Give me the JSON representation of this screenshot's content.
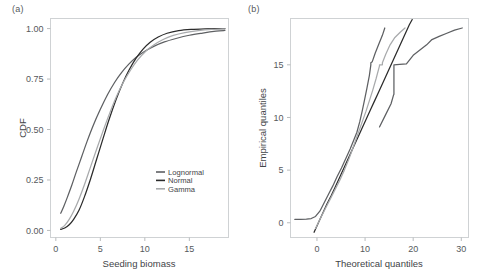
{
  "figure": {
    "panels": [
      {
        "key": "a",
        "label": "(a)",
        "xlabel": "Seeding biomass",
        "ylabel": "CDF"
      },
      {
        "key": "b",
        "label": "(b)",
        "xlabel": "Theoretical quantiles",
        "ylabel": "Empirical quantiles"
      }
    ]
  },
  "legend": {
    "items": [
      {
        "label": "Lognormal",
        "color": "#5e6063"
      },
      {
        "label": "Normal",
        "color": "#2b2b2b"
      },
      {
        "label": "Gamma",
        "color": "#a8aaac"
      }
    ]
  },
  "colors": {
    "lognormal": "#5e6063",
    "normal": "#2b2b2b",
    "gamma": "#a8aaac",
    "axis": "#cfd2d4",
    "tick": "#b9bcbe",
    "text": "#55595c"
  },
  "chart_data": [
    {
      "type": "line",
      "panel": "(a)",
      "title": "",
      "xlabel": "Seeding biomass",
      "ylabel": "CDF",
      "xlim": [
        -0.6,
        19.4
      ],
      "ylim": [
        -0.035,
        1.05
      ],
      "xticks": [
        0,
        5,
        10,
        15
      ],
      "yticks": [
        0.0,
        0.25,
        0.5,
        0.75,
        1.0
      ],
      "xtick_labels": [
        "0",
        "5",
        "10",
        "15"
      ],
      "ytick_labels": [
        "0.00",
        "0.25",
        "0.50",
        "0.75",
        "1.00"
      ],
      "grid": false,
      "legend_position": "lower-right-inside",
      "series": [
        {
          "name": "Lognormal",
          "color": "#5e6063",
          "x": [
            0.55,
            0.9,
            1.3,
            1.8,
            2.3,
            2.9,
            3.5,
            4.2,
            5.0,
            5.8,
            6.6,
            7.4,
            8.2,
            9.0,
            10.0,
            11.0,
            12.2,
            13.5,
            15.0,
            16.5,
            18.0,
            19.0
          ],
          "y": [
            0.085,
            0.12,
            0.165,
            0.225,
            0.29,
            0.365,
            0.44,
            0.52,
            0.6,
            0.672,
            0.733,
            0.783,
            0.824,
            0.857,
            0.888,
            0.912,
            0.934,
            0.951,
            0.967,
            0.978,
            0.987,
            0.991
          ]
        },
        {
          "name": "Normal",
          "color": "#2b2b2b",
          "x": [
            0.55,
            1.0,
            1.5,
            2.0,
            2.6,
            3.2,
            3.9,
            4.6,
            5.3,
            6.0,
            6.8,
            7.5,
            8.2,
            9.0,
            9.8,
            10.6,
            11.5,
            12.5,
            13.8,
            15.2,
            16.8,
            18.2,
            19.0
          ],
          "y": [
            0.005,
            0.012,
            0.028,
            0.055,
            0.1,
            0.165,
            0.255,
            0.355,
            0.455,
            0.552,
            0.652,
            0.728,
            0.792,
            0.852,
            0.898,
            0.932,
            0.958,
            0.977,
            0.99,
            0.996,
            0.999,
            1.0,
            1.0
          ]
        },
        {
          "name": "Gamma",
          "color": "#a8aaac",
          "x": [
            0.55,
            1.0,
            1.5,
            2.0,
            2.6,
            3.2,
            3.9,
            4.6,
            5.3,
            6.0,
            6.8,
            7.6,
            8.4,
            9.2,
            10.1,
            11.0,
            12.0,
            13.2,
            14.5,
            16.0,
            17.5,
            19.0
          ],
          "y": [
            0.01,
            0.025,
            0.055,
            0.095,
            0.155,
            0.225,
            0.315,
            0.405,
            0.492,
            0.575,
            0.662,
            0.735,
            0.795,
            0.845,
            0.888,
            0.919,
            0.945,
            0.966,
            0.98,
            0.99,
            0.996,
            0.999
          ]
        }
      ]
    },
    {
      "type": "line",
      "panel": "(b)",
      "title": "",
      "xlabel": "Theoretical quantiles",
      "ylabel": "Empirical quantiles",
      "xlim": [
        -5.5,
        31.5
      ],
      "ylim": [
        -1.4,
        19.4
      ],
      "xticks": [
        0,
        10,
        20,
        30
      ],
      "yticks": [
        0,
        5,
        10,
        15
      ],
      "xtick_labels": [
        "0",
        "10",
        "20",
        "30"
      ],
      "ytick_labels": [
        "0",
        "5",
        "10",
        "15"
      ],
      "grid": false,
      "legend_position": "none",
      "series": [
        {
          "name": "Lognormal",
          "color": "#5e6063",
          "x": [
            -4.6,
            -3.4,
            -2.2,
            -1.2,
            -0.3,
            0.6,
            1.5,
            2.4,
            3.3,
            4.2,
            5.1,
            6.0,
            6.9,
            7.7,
            8.3,
            8.9,
            9.4,
            9.9,
            10.4,
            10.9,
            11.2,
            11.2,
            11.5,
            12.1,
            12.8,
            13.6,
            14.1
          ],
          "y": [
            0.32,
            0.33,
            0.35,
            0.4,
            0.6,
            1.1,
            1.9,
            2.7,
            3.5,
            4.4,
            5.2,
            6.1,
            7.0,
            7.9,
            8.6,
            9.6,
            10.6,
            11.7,
            12.8,
            14.0,
            15.0,
            15.2,
            15.3,
            16.1,
            16.9,
            17.8,
            18.5
          ]
        },
        {
          "name": "Normal",
          "color": "#2b2b2b",
          "x": [
            -0.6,
            0.3,
            1.2,
            2.1,
            3.0,
            3.9,
            4.8,
            5.7,
            6.6,
            7.5,
            8.4,
            9.3,
            10.2,
            11.1,
            12.0,
            12.9,
            13.8,
            14.7,
            15.6,
            16.5,
            17.4,
            18.3,
            19.2,
            19.8
          ],
          "y": [
            -0.9,
            0.0,
            0.9,
            1.8,
            2.6,
            3.5,
            4.4,
            5.3,
            6.2,
            7.1,
            8.0,
            8.9,
            9.8,
            10.7,
            11.6,
            12.5,
            13.4,
            14.3,
            15.2,
            16.1,
            17.0,
            17.9,
            18.8,
            19.3
          ]
        },
        {
          "name": "Gamma",
          "color": "#a8aaac",
          "x": [
            -0.3,
            0.7,
            1.7,
            2.7,
            3.7,
            4.7,
            5.7,
            6.6,
            7.4,
            8.1,
            8.8,
            9.5,
            10.2,
            10.9,
            11.6,
            12.3,
            13.0,
            13.0,
            13.6,
            13.6,
            14.3,
            15.2,
            16.2,
            17.3,
            18.3
          ],
          "y": [
            -0.55,
            0.4,
            1.3,
            2.2,
            3.1,
            4.0,
            5.0,
            6.0,
            7.0,
            7.9,
            8.8,
            9.7,
            10.6,
            11.6,
            12.6,
            13.7,
            14.9,
            15.0,
            15.0,
            15.2,
            16.0,
            16.9,
            17.6,
            18.1,
            18.5
          ]
        },
        {
          "name": "Gamma-upper-branch",
          "color": "#5e6063",
          "x": [
            13.0,
            14.2,
            15.4,
            15.9,
            16.0,
            16.0,
            17.2,
            18.6,
            20.0,
            21.4,
            22.8,
            23.9,
            25.4,
            27.0,
            28.6,
            30.2
          ],
          "y": [
            9.1,
            10.2,
            11.3,
            12.1,
            12.2,
            15.0,
            15.05,
            15.1,
            15.9,
            16.4,
            16.9,
            17.4,
            17.7,
            18.0,
            18.3,
            18.5
          ]
        }
      ]
    }
  ]
}
